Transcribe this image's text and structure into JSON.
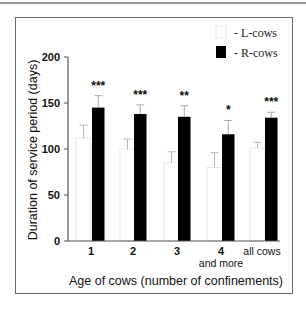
{
  "chart_data": {
    "type": "bar",
    "title": "",
    "xlabel": "Age of cows (number of confinements)",
    "ylabel": "Duration of service period (days)",
    "ylim": [
      0,
      200
    ],
    "yticks": [
      0,
      50,
      100,
      150,
      200
    ],
    "grid": false,
    "legend_position": "top-right",
    "categories": [
      "1",
      "2",
      "3",
      "4 and more",
      "all cows"
    ],
    "category_labels": [
      {
        "line1": "1",
        "line2": ""
      },
      {
        "line1": "2",
        "line2": ""
      },
      {
        "line1": "3",
        "line2": ""
      },
      {
        "line1": "4",
        "line2": "and more"
      },
      {
        "line1": "all cows",
        "line2": ""
      }
    ],
    "series": [
      {
        "name": "L-cows",
        "legend_label": "- L-cows",
        "color": "#ffffff",
        "values": [
          112,
          100,
          85,
          80,
          101
        ],
        "error_upper": [
          126,
          111,
          97,
          96,
          107
        ]
      },
      {
        "name": "R-cows",
        "legend_label": "- R-cows",
        "color": "#000000",
        "values": [
          145,
          138,
          135,
          116,
          134
        ],
        "error_upper": [
          158,
          148,
          147,
          131,
          140
        ]
      }
    ],
    "significance": [
      "***",
      "***",
      "**",
      "*",
      "***"
    ]
  }
}
